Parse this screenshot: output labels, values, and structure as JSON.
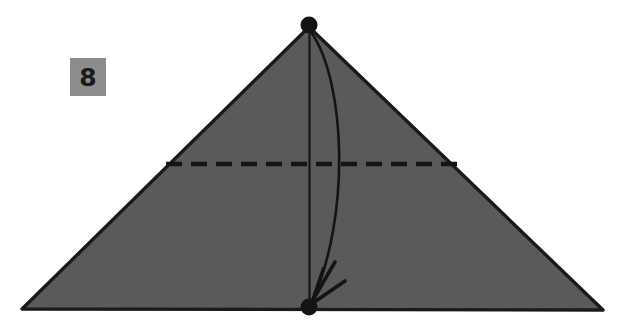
{
  "figure": {
    "kind": "origami-fold-instruction",
    "step_number": "8",
    "background_color": "#ffffff",
    "paper_fill_color": "#5a5a5a",
    "ink_color": "#1a1a1a",
    "badge_color": "#8c8c8c",
    "canvas": {
      "width": 620,
      "height": 325
    },
    "shapes": {
      "triangle": {
        "name": "folded-paper-triangle",
        "apex": [
          309,
          27
        ],
        "bottom_left": [
          22,
          309
        ],
        "bottom_right": [
          603,
          310
        ]
      },
      "crease_vertical": {
        "name": "vertical-crease-line",
        "from": [
          309,
          30
        ],
        "to": [
          309,
          303
        ],
        "style": "solid-thin"
      },
      "crease_horizontal_dashed": {
        "name": "horizontal-fold-line",
        "from": [
          166,
          164
        ],
        "to": [
          458,
          164
        ],
        "style": "dashed",
        "dash_pattern": "16 9"
      },
      "arrow": {
        "name": "fold-down-arrow",
        "start": [
          311,
          32
        ],
        "control": [
          357,
          165
        ],
        "end": [
          311,
          304
        ],
        "style": "curved-with-open-arrowhead",
        "direction": "apex-to-base"
      },
      "dots": [
        {
          "name": "apex-vertex-dot",
          "cx": 309,
          "cy": 25,
          "r": 8
        },
        {
          "name": "base-midpoint-dot",
          "cx": 309,
          "cy": 307,
          "r": 8
        }
      ]
    }
  }
}
